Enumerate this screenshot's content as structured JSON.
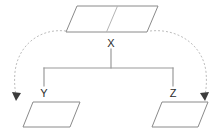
{
  "diagram": {
    "type": "tree-diagram",
    "background_color": "#ffffff",
    "shape_stroke_color": "#8a8a8a",
    "connector_color": "#9a9a9a",
    "curve_color": "#bdbdbd",
    "arrow_color": "#3c3c3c",
    "label_color": "#2b2b2b",
    "nodes": [
      {
        "id": "x",
        "label": "X",
        "shape": "parallelogram",
        "divided": true,
        "label_x": 111,
        "label_y": 47
      },
      {
        "id": "y",
        "label": "Y",
        "shape": "parallelogram",
        "divided": false,
        "label_x": 44,
        "label_y": 97
      },
      {
        "id": "z",
        "label": "Z",
        "shape": "parallelogram",
        "divided": false,
        "label_x": 173,
        "label_y": 97
      }
    ],
    "edges": [
      {
        "from": "x",
        "to": "y",
        "style": "solid"
      },
      {
        "from": "x",
        "to": "z",
        "style": "solid"
      }
    ],
    "curved_arrows": [
      {
        "id": "left-curve",
        "from": "x",
        "direction": "down-left",
        "style": "dotted",
        "arrowhead": true
      },
      {
        "id": "right-curve",
        "from": "x",
        "direction": "down-right",
        "style": "dotted",
        "arrowhead": true
      }
    ]
  }
}
